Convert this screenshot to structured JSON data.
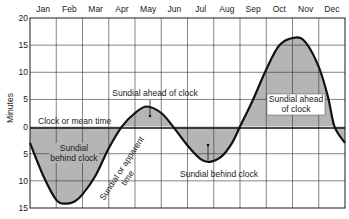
{
  "chart_data": {
    "type": "line",
    "title": "",
    "xlabel": "",
    "ylabel": "Minutes",
    "x_ticks": [
      "Jan",
      "Feb",
      "Mar",
      "Apr",
      "May",
      "Jun",
      "Jul",
      "Aug",
      "Sep",
      "Oct",
      "Nov",
      "Dec"
    ],
    "y_ticks": [
      "20",
      "15",
      "10",
      "5",
      "0",
      "5",
      "10",
      "15"
    ],
    "y_tick_values": [
      20,
      15,
      10,
      5,
      0,
      -5,
      -10,
      -15
    ],
    "ylim": [
      -15,
      20
    ],
    "grid": true,
    "reference_line": {
      "label": "Clock or mean time",
      "value": 0
    },
    "series": [
      {
        "name": "Sundial or apparent time",
        "x_month_position": [
          0.0,
          0.5,
          1.0,
          1.35,
          1.7,
          2.0,
          2.5,
          3.0,
          3.5,
          4.0,
          4.45,
          5.0,
          5.45,
          6.0,
          6.5,
          6.85,
          7.3,
          7.7,
          8.0,
          8.5,
          9.0,
          9.5,
          10.1,
          10.5,
          11.0,
          11.35,
          11.6,
          12.0
        ],
        "values": [
          -3,
          -9,
          -13.5,
          -14.2,
          -13.8,
          -12.5,
          -9,
          -4,
          0,
          2.5,
          3.7,
          2.5,
          0,
          -3.5,
          -6,
          -6.5,
          -5.5,
          -3,
          0,
          5,
          10.5,
          15,
          16.4,
          15.5,
          11,
          5.5,
          0,
          -3
        ]
      }
    ],
    "annotations": [
      {
        "text": "Sundial ahead of clock",
        "position": "May peak"
      },
      {
        "text": "Sundial behind clock",
        "position": "Feb trough"
      },
      {
        "text": "Sundial or apparent time",
        "position": "rising Mar-Apr, rotated"
      },
      {
        "text": "Sundial behind clock",
        "position": "Jul trough"
      },
      {
        "text": "Sundial ahead of clock",
        "position": "Nov peak"
      }
    ]
  },
  "labels": {
    "months": [
      "Jan",
      "Feb",
      "Mar",
      "Apr",
      "May",
      "Jun",
      "Jul",
      "Aug",
      "Sep",
      "Oct",
      "Nov",
      "Dec"
    ],
    "y_ticks": [
      "20",
      "15",
      "10",
      "5",
      "0",
      "5",
      "10",
      "15"
    ],
    "ylabel": "Minutes",
    "zero_line": "Clock or mean time",
    "may_ahead": "Sundial ahead of clock",
    "feb_behind_1": "Sundial",
    "feb_behind_2": "behind clock",
    "apparent_1": "Sundial or apparent",
    "apparent_2": "time",
    "jul_behind": "Sundial behind clock",
    "nov_ahead_1": "Sundial ahead",
    "nov_ahead_2": "of clock"
  }
}
